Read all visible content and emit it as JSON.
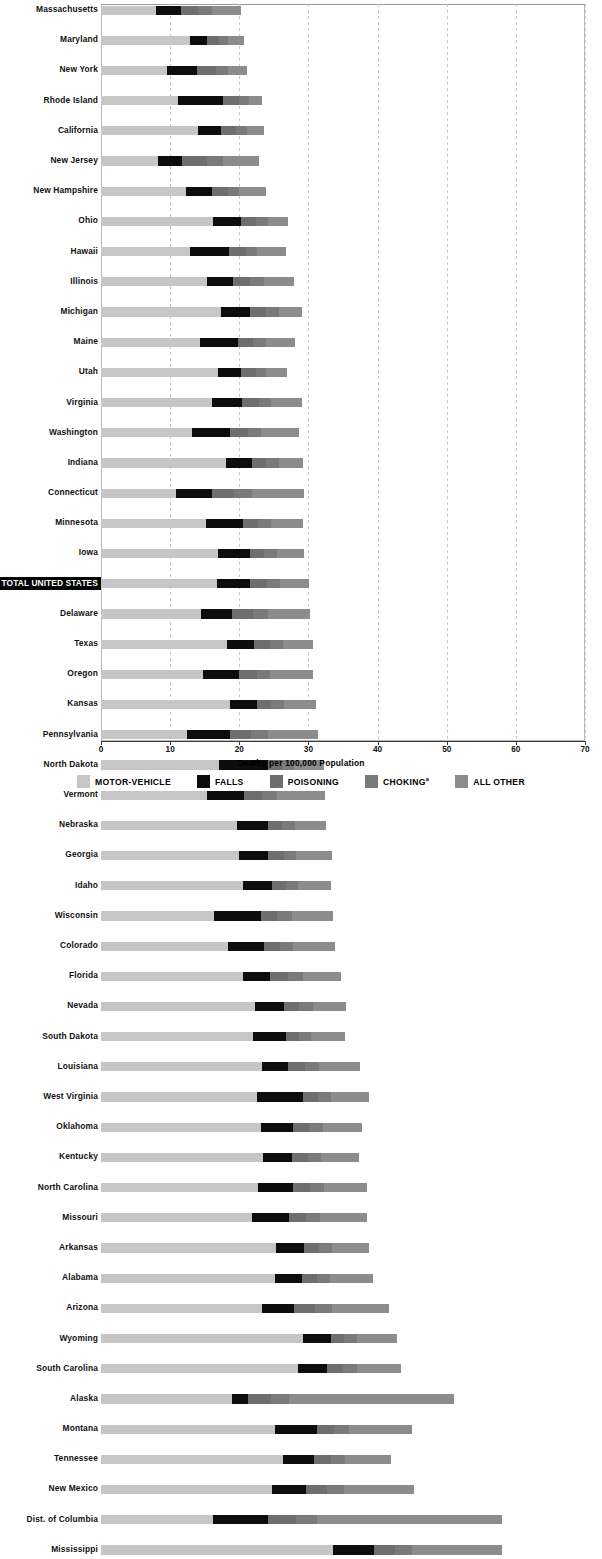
{
  "chart_data": {
    "type": "bar",
    "orientation": "horizontal",
    "stacked": true,
    "title": "",
    "xlabel": "Deaths per 100,000 Population",
    "ylabel": "",
    "xlim": [
      0,
      70
    ],
    "xticks": [
      0,
      10,
      20,
      30,
      40,
      50,
      60,
      70
    ],
    "grid": "vertical-dashed",
    "legend_position": "bottom",
    "series": [
      {
        "name": "MOTOR-VEHICLE",
        "color": "#c6c6c6"
      },
      {
        "name": "FALLS",
        "color": "#0d0d0d"
      },
      {
        "name": "POISONING",
        "color": "#6e6e6e"
      },
      {
        "name": "CHOKING",
        "color": "#7a7a7a"
      },
      {
        "name": "ALL OTHER",
        "color": "#8c8c8c"
      }
    ],
    "footnote_marker": "a",
    "categories": [
      "Massachusetts",
      "Maryland",
      "New York",
      "Rhode Island",
      "California",
      "New Jersey",
      "New Hampshire",
      "Ohio",
      "Hawaii",
      "Illinois",
      "Michigan",
      "Maine",
      "Utah",
      "Virginia",
      "Washington",
      "Indiana",
      "Connecticut",
      "Minnesota",
      "Iowa",
      "TOTAL UNITED STATES",
      "Delaware",
      "Texas",
      "Oregon",
      "Kansas",
      "Pennsylvania",
      "North Dakota",
      "Vermont",
      "Nebraska",
      "Georgia",
      "Idaho",
      "Wisconsin",
      "Colorado",
      "Florida",
      "Nevada",
      "South Dakota",
      "Louisiana",
      "West Virginia",
      "Oklahoma",
      "Kentucky",
      "North Carolina",
      "Missouri",
      "Arkansas",
      "Alabama",
      "Arizona",
      "Wyoming",
      "South Carolina",
      "Alaska",
      "Montana",
      "Tennessee",
      "New Mexico",
      "Dist. of Columbia",
      "Mississippi"
    ],
    "rows": [
      {
        "state": "Massachusetts",
        "motor_vehicle": 8.0,
        "falls": 3.5,
        "poisoning": 2.5,
        "choking": 2.0,
        "all_other": 4.3,
        "total": 20.3,
        "highlight": false
      },
      {
        "state": "Maryland",
        "motor_vehicle": 12.8,
        "falls": 2.6,
        "poisoning": 1.6,
        "choking": 1.4,
        "all_other": 2.3,
        "total": 20.7,
        "highlight": false
      },
      {
        "state": "New York",
        "motor_vehicle": 9.6,
        "falls": 4.3,
        "poisoning": 2.7,
        "choking": 1.8,
        "all_other": 2.7,
        "total": 21.1,
        "highlight": false
      },
      {
        "state": "Rhode Island",
        "motor_vehicle": 11.2,
        "falls": 6.5,
        "poisoning": 2.3,
        "choking": 1.4,
        "all_other": 1.9,
        "total": 23.3,
        "highlight": false
      },
      {
        "state": "California",
        "motor_vehicle": 14.1,
        "falls": 3.2,
        "poisoning": 2.2,
        "choking": 1.6,
        "all_other": 2.5,
        "total": 23.6,
        "highlight": false
      },
      {
        "state": "New Jersey",
        "motor_vehicle": 8.3,
        "falls": 3.4,
        "poisoning": 3.6,
        "choking": 2.4,
        "all_other": 5.2,
        "total": 22.9,
        "highlight": false
      },
      {
        "state": "New Hampshire",
        "motor_vehicle": 12.3,
        "falls": 3.8,
        "poisoning": 2.2,
        "choking": 1.7,
        "all_other": 3.8,
        "total": 23.8,
        "highlight": false
      },
      {
        "state": "Ohio",
        "motor_vehicle": 16.2,
        "falls": 4.0,
        "poisoning": 2.2,
        "choking": 1.8,
        "all_other": 2.9,
        "total": 27.1,
        "highlight": false
      },
      {
        "state": "Hawaii",
        "motor_vehicle": 12.9,
        "falls": 5.6,
        "poisoning": 2.4,
        "choking": 1.7,
        "all_other": 4.1,
        "total": 26.7,
        "highlight": false
      },
      {
        "state": "Illinois",
        "motor_vehicle": 15.3,
        "falls": 3.8,
        "poisoning": 2.5,
        "choking": 2.0,
        "all_other": 4.3,
        "total": 27.9,
        "highlight": false
      },
      {
        "state": "Michigan",
        "motor_vehicle": 17.4,
        "falls": 4.2,
        "poisoning": 2.3,
        "choking": 1.9,
        "all_other": 3.3,
        "total": 29.1,
        "highlight": false
      },
      {
        "state": "Maine",
        "motor_vehicle": 14.3,
        "falls": 5.5,
        "poisoning": 2.2,
        "choking": 1.8,
        "all_other": 4.3,
        "total": 28.1,
        "highlight": false
      },
      {
        "state": "Utah",
        "motor_vehicle": 16.9,
        "falls": 3.4,
        "poisoning": 2.1,
        "choking": 1.5,
        "all_other": 3.0,
        "total": 26.9,
        "highlight": false
      },
      {
        "state": "Virginia",
        "motor_vehicle": 16.1,
        "falls": 4.3,
        "poisoning": 2.4,
        "choking": 1.8,
        "all_other": 4.5,
        "total": 29.1,
        "highlight": false
      },
      {
        "state": "Washington",
        "motor_vehicle": 13.1,
        "falls": 5.5,
        "poisoning": 2.6,
        "choking": 2.0,
        "all_other": 5.5,
        "total": 28.7,
        "highlight": false
      },
      {
        "state": "Indiana",
        "motor_vehicle": 18.1,
        "falls": 3.7,
        "poisoning": 2.1,
        "choking": 1.8,
        "all_other": 3.5,
        "total": 29.2,
        "highlight": false
      },
      {
        "state": "Connecticut",
        "motor_vehicle": 10.8,
        "falls": 5.3,
        "poisoning": 3.2,
        "choking": 2.5,
        "all_other": 7.5,
        "total": 29.3,
        "highlight": false
      },
      {
        "state": "Minnesota",
        "motor_vehicle": 15.2,
        "falls": 5.3,
        "poisoning": 2.2,
        "choking": 1.9,
        "all_other": 4.6,
        "total": 29.2,
        "highlight": false
      },
      {
        "state": "Iowa",
        "motor_vehicle": 16.9,
        "falls": 4.7,
        "poisoning": 2.0,
        "choking": 1.8,
        "all_other": 4.0,
        "total": 29.4,
        "highlight": false
      },
      {
        "state": "TOTAL UNITED STATES",
        "motor_vehicle": 16.8,
        "falls": 4.7,
        "poisoning": 2.5,
        "choking": 1.9,
        "all_other": 4.2,
        "total": 30.1,
        "highlight": true
      },
      {
        "state": "Delaware",
        "motor_vehicle": 14.5,
        "falls": 4.5,
        "poisoning": 3.0,
        "choking": 2.1,
        "all_other": 6.1,
        "total": 30.2,
        "highlight": false
      },
      {
        "state": "Texas",
        "motor_vehicle": 18.2,
        "falls": 3.9,
        "poisoning": 2.3,
        "choking": 1.9,
        "all_other": 4.3,
        "total": 30.6,
        "highlight": false
      },
      {
        "state": "Oregon",
        "motor_vehicle": 14.8,
        "falls": 5.2,
        "poisoning": 2.5,
        "choking": 2.0,
        "all_other": 6.2,
        "total": 30.7,
        "highlight": false
      },
      {
        "state": "Kansas",
        "motor_vehicle": 18.6,
        "falls": 4.0,
        "poisoning": 2.0,
        "choking": 1.9,
        "all_other": 4.6,
        "total": 31.1,
        "highlight": false
      },
      {
        "state": "Pennsylvania",
        "motor_vehicle": 12.4,
        "falls": 6.2,
        "poisoning": 3.1,
        "choking": 2.4,
        "all_other": 7.3,
        "total": 31.4,
        "highlight": false
      },
      {
        "state": "North Dakota",
        "motor_vehicle": 17.0,
        "falls": 7.2,
        "poisoning": 2.0,
        "choking": 1.7,
        "all_other": 4.3,
        "total": 32.2,
        "highlight": false
      },
      {
        "state": "Vermont",
        "motor_vehicle": 15.3,
        "falls": 5.4,
        "poisoning": 2.6,
        "choking": 2.1,
        "all_other": 7.0,
        "total": 32.4,
        "highlight": false
      },
      {
        "state": "Nebraska",
        "motor_vehicle": 19.6,
        "falls": 4.6,
        "poisoning": 2.0,
        "choking": 1.8,
        "all_other": 4.6,
        "total": 32.6,
        "highlight": false
      },
      {
        "state": "Georgia",
        "motor_vehicle": 20.0,
        "falls": 4.1,
        "poisoning": 2.3,
        "choking": 1.8,
        "all_other": 5.2,
        "total": 33.4,
        "highlight": false
      },
      {
        "state": "Idaho",
        "motor_vehicle": 20.6,
        "falls": 4.2,
        "poisoning": 2.0,
        "choking": 1.7,
        "all_other": 4.8,
        "total": 33.3,
        "highlight": false
      },
      {
        "state": "Wisconsin",
        "motor_vehicle": 16.4,
        "falls": 6.8,
        "poisoning": 2.3,
        "choking": 2.1,
        "all_other": 6.0,
        "total": 33.6,
        "highlight": false
      },
      {
        "state": "Colorado",
        "motor_vehicle": 18.4,
        "falls": 5.2,
        "poisoning": 2.3,
        "choking": 1.9,
        "all_other": 6.1,
        "total": 33.9,
        "highlight": false
      },
      {
        "state": "Florida",
        "motor_vehicle": 20.6,
        "falls": 3.9,
        "poisoning": 2.6,
        "choking": 2.1,
        "all_other": 5.5,
        "total": 34.7,
        "highlight": false
      },
      {
        "state": "Nevada",
        "motor_vehicle": 22.3,
        "falls": 4.1,
        "poisoning": 2.3,
        "choking": 1.9,
        "all_other": 4.8,
        "total": 35.4,
        "highlight": false
      },
      {
        "state": "South Dakota",
        "motor_vehicle": 22.0,
        "falls": 4.8,
        "poisoning": 1.9,
        "choking": 1.7,
        "all_other": 4.9,
        "total": 35.3,
        "highlight": false
      },
      {
        "state": "Louisiana",
        "motor_vehicle": 23.3,
        "falls": 3.8,
        "poisoning": 2.4,
        "choking": 2.0,
        "all_other": 5.9,
        "total": 37.4,
        "highlight": false
      },
      {
        "state": "West Virginia",
        "motor_vehicle": 22.6,
        "falls": 6.6,
        "poisoning": 2.2,
        "choking": 1.9,
        "all_other": 5.4,
        "total": 38.7,
        "highlight": false
      },
      {
        "state": "Oklahoma",
        "motor_vehicle": 23.2,
        "falls": 4.6,
        "poisoning": 2.3,
        "choking": 2.0,
        "all_other": 5.6,
        "total": 37.7,
        "highlight": false
      },
      {
        "state": "Kentucky",
        "motor_vehicle": 23.5,
        "falls": 4.1,
        "poisoning": 2.3,
        "choking": 1.9,
        "all_other": 5.5,
        "total": 37.3,
        "highlight": false
      },
      {
        "state": "North Carolina",
        "motor_vehicle": 22.7,
        "falls": 5.0,
        "poisoning": 2.5,
        "choking": 2.0,
        "all_other": 6.3,
        "total": 38.5,
        "highlight": false
      },
      {
        "state": "Missouri",
        "motor_vehicle": 21.9,
        "falls": 5.3,
        "poisoning": 2.4,
        "choking": 2.1,
        "all_other": 6.8,
        "total": 38.5,
        "highlight": false
      },
      {
        "state": "Arkansas",
        "motor_vehicle": 25.3,
        "falls": 4.0,
        "poisoning": 2.2,
        "choking": 1.9,
        "all_other": 5.4,
        "total": 38.8,
        "highlight": false
      },
      {
        "state": "Alabama",
        "motor_vehicle": 25.1,
        "falls": 3.9,
        "poisoning": 2.2,
        "choking": 1.9,
        "all_other": 6.3,
        "total": 39.4,
        "highlight": false
      },
      {
        "state": "Arizona",
        "motor_vehicle": 23.3,
        "falls": 4.6,
        "poisoning": 3.1,
        "choking": 2.4,
        "all_other": 8.2,
        "total": 41.6,
        "highlight": false
      },
      {
        "state": "Wyoming",
        "motor_vehicle": 29.2,
        "falls": 4.0,
        "poisoning": 2.0,
        "choking": 1.8,
        "all_other": 5.8,
        "total": 42.8,
        "highlight": false
      },
      {
        "state": "South Carolina",
        "motor_vehicle": 28.5,
        "falls": 4.2,
        "poisoning": 2.3,
        "choking": 2.0,
        "all_other": 6.4,
        "total": 43.4,
        "highlight": false
      },
      {
        "state": "Alaska",
        "motor_vehicle": 19.0,
        "falls": 2.2,
        "poisoning": 3.4,
        "choking": 2.6,
        "all_other": 23.8,
        "total": 51.0,
        "highlight": false
      },
      {
        "state": "Montana",
        "motor_vehicle": 25.2,
        "falls": 6.0,
        "poisoning": 2.5,
        "choking": 2.2,
        "all_other": 9.1,
        "total": 45.0,
        "highlight": false
      },
      {
        "state": "Tennessee",
        "motor_vehicle": 26.3,
        "falls": 4.5,
        "poisoning": 2.4,
        "choking": 2.1,
        "all_other": 6.7,
        "total": 42.0,
        "highlight": false
      },
      {
        "state": "New Mexico",
        "motor_vehicle": 24.7,
        "falls": 5.0,
        "poisoning": 3.0,
        "choking": 2.5,
        "all_other": 10.1,
        "total": 45.3,
        "highlight": false
      },
      {
        "state": "Dist. of Columbia",
        "motor_vehicle": 16.2,
        "falls": 8.0,
        "poisoning": 4.0,
        "choking": 3.0,
        "all_other": 26.8,
        "total": 58.0,
        "highlight": false
      },
      {
        "state": "Mississippi",
        "motor_vehicle": 33.5,
        "falls": 6.0,
        "poisoning": 3.0,
        "choking": 2.5,
        "all_other": 13.0,
        "total": 58.0,
        "highlight": false
      }
    ]
  },
  "axis": {
    "tick_labels": [
      "0",
      "10",
      "20",
      "30",
      "40",
      "50",
      "60",
      "70"
    ],
    "title": "Deaths per 100,000 Population"
  },
  "legend": {
    "items": [
      {
        "label": "MOTOR-VEHICLE",
        "key": "mv"
      },
      {
        "label": "FALLS",
        "key": "fa"
      },
      {
        "label": "POISONING",
        "key": "po"
      },
      {
        "label": "CHOKING",
        "key": "ch",
        "superscript": "a"
      },
      {
        "label": "ALL OTHER",
        "key": "ao"
      }
    ]
  }
}
